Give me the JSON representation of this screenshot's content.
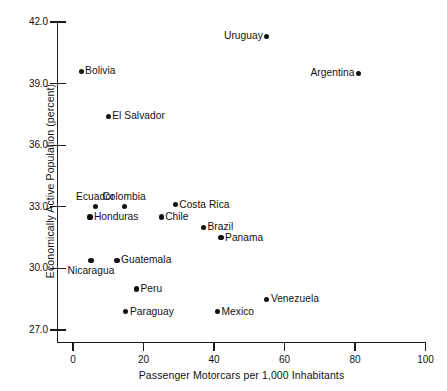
{
  "chart_data": {
    "type": "scatter",
    "title": "",
    "xlabel": "Passenger Motorcars per 1,000 Inhabitants",
    "ylabel": "Economically Active Population (percent)",
    "xlim": [
      0,
      100
    ],
    "ylim": [
      27.0,
      42.0
    ],
    "xticks": [
      "0",
      "20",
      "40",
      "60",
      "80",
      "100"
    ],
    "yticks": [
      "42.0",
      "39.0",
      "36.0",
      "33.0",
      "30.0",
      "27.0"
    ],
    "grid": false,
    "legend": "none",
    "points": [
      {
        "label": "Uruguay",
        "x": 55.0,
        "y": 41.3,
        "label_pos": "left"
      },
      {
        "label": "Argentina",
        "x": 81.0,
        "y": 39.5,
        "label_pos": "left"
      },
      {
        "label": "Bolivia",
        "x": 2.3,
        "y": 39.6,
        "label_pos": "right"
      },
      {
        "label": "El Salvador",
        "x": 10.0,
        "y": 37.4,
        "label_pos": "right"
      },
      {
        "label": "Ecuador",
        "x": 6.3,
        "y": 33.0,
        "label_pos": "above"
      },
      {
        "label": "Colombia",
        "x": 14.5,
        "y": 33.0,
        "label_pos": "above"
      },
      {
        "label": "Costa Rica",
        "x": 29.0,
        "y": 33.1,
        "label_pos": "right"
      },
      {
        "label": "Honduras",
        "x": 4.8,
        "y": 32.5,
        "label_pos": "right"
      },
      {
        "label": "Chile",
        "x": 25.0,
        "y": 32.5,
        "label_pos": "right"
      },
      {
        "label": "Brazil",
        "x": 37.0,
        "y": 32.0,
        "label_pos": "right"
      },
      {
        "label": "Panama",
        "x": 42.0,
        "y": 31.5,
        "label_pos": "right"
      },
      {
        "label": "Nicaragua",
        "x": 5.1,
        "y": 30.4,
        "label_pos": "below"
      },
      {
        "label": "Guatemala",
        "x": 12.5,
        "y": 30.4,
        "label_pos": "right"
      },
      {
        "label": "Peru",
        "x": 18.0,
        "y": 29.0,
        "label_pos": "right"
      },
      {
        "label": "Venezuela",
        "x": 55.0,
        "y": 28.5,
        "label_pos": "right"
      },
      {
        "label": "Paraguay",
        "x": 15.0,
        "y": 27.9,
        "label_pos": "right"
      },
      {
        "label": "Mexico",
        "x": 41.0,
        "y": 27.9,
        "label_pos": "right"
      }
    ]
  }
}
